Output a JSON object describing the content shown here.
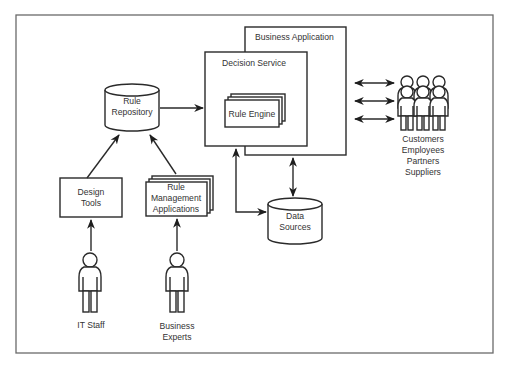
{
  "diagram": {
    "nodes": {
      "rule_repository": {
        "line1": "Rule",
        "line2": "Repository",
        "shape": "cylinder"
      },
      "business_application": {
        "label": "Business Application",
        "shape": "box"
      },
      "decision_service": {
        "label": "Decision Service",
        "shape": "box"
      },
      "rule_engine": {
        "label": "Rule Engine",
        "shape": "stacked-box"
      },
      "design_tools": {
        "line1": "Design",
        "line2": "Tools",
        "shape": "box"
      },
      "rule_mgmt_apps": {
        "line1": "Rule",
        "line2": "Management",
        "line3": "Applications",
        "shape": "stacked-box"
      },
      "data_sources": {
        "line1": "Data",
        "line2": "Sources",
        "shape": "cylinder"
      },
      "it_staff": {
        "label": "IT Staff",
        "shape": "person"
      },
      "business_experts": {
        "line1": "Business",
        "line2": "Experts",
        "shape": "person"
      },
      "external_users": {
        "shape": "person-group",
        "lines": [
          "Customers",
          "Employees",
          "Partners",
          "Suppliers"
        ]
      }
    },
    "edges": [
      {
        "from": "Rule Repository",
        "to": "Decision Service",
        "type": "arrow"
      },
      {
        "from": "Design Tools",
        "to": "Rule Repository",
        "type": "arrow"
      },
      {
        "from": "Rule Management Applications",
        "to": "Rule Repository",
        "type": "arrow"
      },
      {
        "from": "IT Staff",
        "to": "Design Tools",
        "type": "arrow"
      },
      {
        "from": "Business Experts",
        "to": "Rule Management Applications",
        "type": "arrow"
      },
      {
        "from": "Data Sources",
        "to": "Decision Service",
        "type": "arrow"
      },
      {
        "from": "Business Application",
        "to": "Data Sources",
        "type": "bidirectional"
      },
      {
        "from": "Business Application",
        "to": "Customers/Employees/Partners/Suppliers",
        "type": "bidirectional",
        "count": 3
      }
    ],
    "colors": {
      "stroke": "#2a2a2a",
      "frame": "#6a6a6a",
      "text": "#333333",
      "background": "#ffffff"
    }
  }
}
